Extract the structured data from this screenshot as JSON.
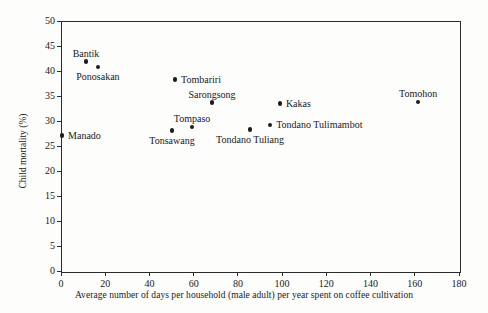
{
  "chart_data": {
    "type": "scatter",
    "title": "",
    "xlabel": "Average number of days per household (male adult) per year spent on coffee cultivation",
    "ylabel": "Child mortality (%)",
    "xlim": [
      0,
      180
    ],
    "ylim": [
      0,
      50
    ],
    "xticks": [
      0,
      20,
      40,
      60,
      80,
      100,
      120,
      140,
      160,
      180
    ],
    "yticks": [
      0,
      5,
      10,
      15,
      20,
      25,
      30,
      35,
      40,
      45,
      50
    ],
    "grid": false,
    "legend": "none",
    "points": [
      {
        "label": "Manado",
        "x": 0.5,
        "y": 27.1,
        "label_pos": "pl-right"
      },
      {
        "label": "Bantik",
        "x": 11.3,
        "y": 41.9,
        "label_pos": "pl-above"
      },
      {
        "label": "Ponosakan",
        "x": 16.7,
        "y": 40.8,
        "label_pos": "pl-below"
      },
      {
        "label": "Tombariri",
        "x": 51.6,
        "y": 38.3,
        "label_pos": "pl-right"
      },
      {
        "label": "Tonsawang",
        "x": 50.2,
        "y": 28.1,
        "label_pos": "pl-below"
      },
      {
        "label": "Tompaso",
        "x": 59.3,
        "y": 28.8,
        "label_pos": "pl-above"
      },
      {
        "label": "Sarongsong",
        "x": 68.3,
        "y": 33.7,
        "label_pos": "pl-above"
      },
      {
        "label": "Tondano Tuliang",
        "x": 85.5,
        "y": 28.3,
        "label_pos": "pl-below"
      },
      {
        "label": "Kakas",
        "x": 99.0,
        "y": 33.5,
        "label_pos": "pl-right"
      },
      {
        "label": "Tondano Tulimambot",
        "x": 94.6,
        "y": 29.2,
        "label_pos": "pl-right"
      },
      {
        "label": "Tomohon",
        "x": 161.5,
        "y": 33.8,
        "label_pos": "pl-above"
      }
    ]
  },
  "colors": {
    "point": "#1c1c1c",
    "axis": "#2b2b2b",
    "background": "#fdfdfc"
  }
}
